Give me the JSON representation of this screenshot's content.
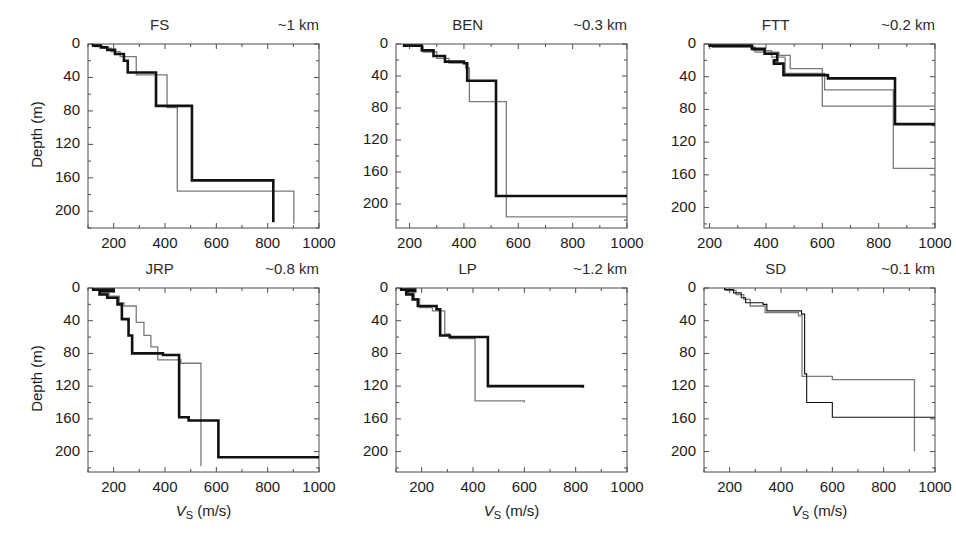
{
  "figure": {
    "ylabel": "Depth (m)",
    "xlabel_symbol": "V",
    "xlabel_subscript": "S",
    "xlabel_units": " (m/s)",
    "y_ticks": [
      0,
      40,
      80,
      120,
      160,
      200
    ],
    "x_ticks": [
      200,
      400,
      600,
      800,
      1000
    ],
    "colors": {
      "primary_profile": "#111111",
      "secondary_profile": "#7a7a7a",
      "axis": "#4d4d4d",
      "background": "#ffffff"
    }
  },
  "chart_data": [
    {
      "type": "line",
      "title": "FS",
      "annotation": "~1 km",
      "xlabel": "VS (m/s)",
      "ylabel": "Depth (m)",
      "xlim": [
        100,
        1000
      ],
      "ylim": [
        0,
        220
      ],
      "y_inverted": true,
      "grid": false,
      "x_ticks": [
        200,
        400,
        600,
        800,
        1000
      ],
      "y_ticks": [
        0,
        40,
        80,
        120,
        160,
        200
      ],
      "series": [
        {
          "name": "black-profile",
          "style": "thick-black",
          "layers": [
            {
              "vs": 120,
              "top": 0,
              "bottom": 2
            },
            {
              "vs": 150,
              "top": 2,
              "bottom": 4
            },
            {
              "vs": 175,
              "top": 4,
              "bottom": 7
            },
            {
              "vs": 205,
              "top": 7,
              "bottom": 12
            },
            {
              "vs": 240,
              "top": 12,
              "bottom": 20
            },
            {
              "vs": 255,
              "top": 20,
              "bottom": 34
            },
            {
              "vs": 365,
              "top": 34,
              "bottom": 74
            },
            {
              "vs": 505,
              "top": 74,
              "bottom": 163
            },
            {
              "vs": 822,
              "top": 163,
              "bottom": 213
            }
          ]
        },
        {
          "name": "gray-profile",
          "style": "thin-gray",
          "layers": [
            {
              "vs": 125,
              "top": 0,
              "bottom": 3
            },
            {
              "vs": 160,
              "top": 3,
              "bottom": 5
            },
            {
              "vs": 190,
              "top": 5,
              "bottom": 9
            },
            {
              "vs": 225,
              "top": 9,
              "bottom": 15
            },
            {
              "vs": 288,
              "top": 15,
              "bottom": 37
            },
            {
              "vs": 408,
              "top": 37,
              "bottom": 76
            },
            {
              "vs": 448,
              "top": 76,
              "bottom": 176
            },
            {
              "vs": 902,
              "top": 176,
              "bottom": 215
            }
          ]
        }
      ]
    },
    {
      "type": "line",
      "title": "BEN",
      "annotation": "~0.3 km",
      "xlabel": "VS (m/s)",
      "ylabel": "Depth (m)",
      "xlim": [
        150,
        1000
      ],
      "ylim": [
        0,
        230
      ],
      "y_inverted": true,
      "grid": false,
      "x_ticks": [
        200,
        400,
        600,
        800,
        1000
      ],
      "y_ticks": [
        0,
        40,
        80,
        120,
        160,
        200
      ],
      "series": [
        {
          "name": "black-profile",
          "style": "thick-black",
          "layers": [
            {
              "vs": 180,
              "top": 0,
              "bottom": 2
            },
            {
              "vs": 245,
              "top": 2,
              "bottom": 8
            },
            {
              "vs": 288,
              "top": 8,
              "bottom": 15
            },
            {
              "vs": 330,
              "top": 15,
              "bottom": 22
            },
            {
              "vs": 400,
              "top": 22,
              "bottom": 24
            },
            {
              "vs": 412,
              "top": 24,
              "bottom": 46
            },
            {
              "vs": 518,
              "top": 46,
              "bottom": 190
            },
            {
              "vs": 1000,
              "top": 190,
              "bottom": 190
            }
          ]
        },
        {
          "name": "gray-profile",
          "style": "thin-gray",
          "layers": [
            {
              "vs": 185,
              "top": 0,
              "bottom": 3
            },
            {
              "vs": 250,
              "top": 3,
              "bottom": 10
            },
            {
              "vs": 300,
              "top": 10,
              "bottom": 18
            },
            {
              "vs": 345,
              "top": 18,
              "bottom": 24
            },
            {
              "vs": 406,
              "top": 24,
              "bottom": 30
            },
            {
              "vs": 420,
              "top": 30,
              "bottom": 72
            },
            {
              "vs": 556,
              "top": 72,
              "bottom": 216
            },
            {
              "vs": 1000,
              "top": 216,
              "bottom": 216
            }
          ]
        }
      ]
    },
    {
      "type": "line",
      "title": "FTT",
      "annotation": "~0.2 km",
      "xlabel": "VS (m/s)",
      "ylabel": "Depth (m)",
      "xlim": [
        180,
        1000
      ],
      "ylim": [
        0,
        225
      ],
      "y_inverted": true,
      "grid": false,
      "x_ticks": [
        200,
        400,
        600,
        800,
        1000
      ],
      "y_ticks": [
        0,
        40,
        80,
        120,
        160,
        200
      ],
      "series": [
        {
          "name": "black-profile",
          "style": "thick-black",
          "layers": [
            {
              "vs": 200,
              "top": 0,
              "bottom": 2
            },
            {
              "vs": 350,
              "top": 2,
              "bottom": 6
            },
            {
              "vs": 395,
              "top": 6,
              "bottom": 12
            },
            {
              "vs": 440,
              "top": 12,
              "bottom": 20
            },
            {
              "vs": 428,
              "top": 20,
              "bottom": 24
            },
            {
              "vs": 462,
              "top": 24,
              "bottom": 38
            },
            {
              "vs": 620,
              "top": 38,
              "bottom": 42
            },
            {
              "vs": 858,
              "top": 42,
              "bottom": 98
            },
            {
              "vs": 1000,
              "top": 98,
              "bottom": 98
            }
          ]
        },
        {
          "name": "gray-profile-1",
          "style": "thin-gray",
          "layers": [
            {
              "vs": 205,
              "top": 0,
              "bottom": 3
            },
            {
              "vs": 355,
              "top": 3,
              "bottom": 8
            },
            {
              "vs": 420,
              "top": 8,
              "bottom": 16
            },
            {
              "vs": 468,
              "top": 16,
              "bottom": 36
            },
            {
              "vs": 608,
              "top": 36,
              "bottom": 56
            },
            {
              "vs": 852,
              "top": 56,
              "bottom": 152
            },
            {
              "vs": 1000,
              "top": 152,
              "bottom": 152
            }
          ]
        },
        {
          "name": "gray-profile-2",
          "style": "thin-gray",
          "layers": [
            {
              "vs": 210,
              "top": 0,
              "bottom": 4
            },
            {
              "vs": 362,
              "top": 4,
              "bottom": 10
            },
            {
              "vs": 446,
              "top": 10,
              "bottom": 14
            },
            {
              "vs": 486,
              "top": 14,
              "bottom": 30
            },
            {
              "vs": 600,
              "top": 30,
              "bottom": 76
            },
            {
              "vs": 1000,
              "top": 76,
              "bottom": 76
            }
          ]
        }
      ]
    },
    {
      "type": "line",
      "title": "JRP",
      "annotation": "~0.8 km",
      "xlabel": "VS (m/s)",
      "ylabel": "Depth (m)",
      "xlim": [
        100,
        1000
      ],
      "ylim": [
        0,
        225
      ],
      "y_inverted": true,
      "grid": false,
      "x_ticks": [
        200,
        400,
        600,
        800,
        1000
      ],
      "y_ticks": [
        0,
        40,
        80,
        120,
        160,
        200
      ],
      "series": [
        {
          "name": "black-profile",
          "style": "thick-black",
          "layers": [
            {
              "vs": 120,
              "top": 0,
              "bottom": 2
            },
            {
              "vs": 200,
              "top": 2,
              "bottom": 4
            },
            {
              "vs": 145,
              "top": 4,
              "bottom": 8
            },
            {
              "vs": 175,
              "top": 8,
              "bottom": 12
            },
            {
              "vs": 215,
              "top": 12,
              "bottom": 20
            },
            {
              "vs": 232,
              "top": 20,
              "bottom": 38
            },
            {
              "vs": 258,
              "top": 38,
              "bottom": 58
            },
            {
              "vs": 272,
              "top": 58,
              "bottom": 80
            },
            {
              "vs": 392,
              "top": 80,
              "bottom": 82
            },
            {
              "vs": 455,
              "top": 82,
              "bottom": 158
            },
            {
              "vs": 492,
              "top": 158,
              "bottom": 162
            },
            {
              "vs": 608,
              "top": 162,
              "bottom": 207
            },
            {
              "vs": 1000,
              "top": 207,
              "bottom": 207
            }
          ]
        },
        {
          "name": "gray-profile",
          "style": "thin-gray",
          "layers": [
            {
              "vs": 125,
              "top": 0,
              "bottom": 3
            },
            {
              "vs": 150,
              "top": 3,
              "bottom": 6
            },
            {
              "vs": 182,
              "top": 6,
              "bottom": 10
            },
            {
              "vs": 222,
              "top": 10,
              "bottom": 18
            },
            {
              "vs": 240,
              "top": 18,
              "bottom": 22
            },
            {
              "vs": 288,
              "top": 22,
              "bottom": 42
            },
            {
              "vs": 318,
              "top": 42,
              "bottom": 58
            },
            {
              "vs": 345,
              "top": 58,
              "bottom": 72
            },
            {
              "vs": 372,
              "top": 72,
              "bottom": 88
            },
            {
              "vs": 462,
              "top": 88,
              "bottom": 92
            },
            {
              "vs": 540,
              "top": 92,
              "bottom": 218
            }
          ]
        }
      ]
    },
    {
      "type": "line",
      "title": "LP",
      "annotation": "~1.2 km",
      "xlabel": "VS (m/s)",
      "ylabel": "Depth (m)",
      "xlim": [
        100,
        1000
      ],
      "ylim": [
        0,
        225
      ],
      "y_inverted": true,
      "grid": false,
      "x_ticks": [
        200,
        400,
        600,
        800,
        1000
      ],
      "y_ticks": [
        0,
        40,
        80,
        120,
        160,
        200
      ],
      "series": [
        {
          "name": "black-profile",
          "style": "thick-black",
          "layers": [
            {
              "vs": 120,
              "top": 0,
              "bottom": 2
            },
            {
              "vs": 175,
              "top": 2,
              "bottom": 4
            },
            {
              "vs": 140,
              "top": 4,
              "bottom": 8
            },
            {
              "vs": 165,
              "top": 8,
              "bottom": 14
            },
            {
              "vs": 185,
              "top": 14,
              "bottom": 22
            },
            {
              "vs": 258,
              "top": 22,
              "bottom": 26
            },
            {
              "vs": 272,
              "top": 26,
              "bottom": 58
            },
            {
              "vs": 310,
              "top": 58,
              "bottom": 60
            },
            {
              "vs": 458,
              "top": 60,
              "bottom": 120
            },
            {
              "vs": 828,
              "top": 120,
              "bottom": 122
            }
          ]
        },
        {
          "name": "gray-profile",
          "style": "thin-gray",
          "layers": [
            {
              "vs": 122,
              "top": 0,
              "bottom": 3
            },
            {
              "vs": 148,
              "top": 3,
              "bottom": 7
            },
            {
              "vs": 172,
              "top": 7,
              "bottom": 13
            },
            {
              "vs": 192,
              "top": 13,
              "bottom": 24
            },
            {
              "vs": 242,
              "top": 24,
              "bottom": 28
            },
            {
              "vs": 290,
              "top": 28,
              "bottom": 56
            },
            {
              "vs": 308,
              "top": 56,
              "bottom": 62
            },
            {
              "vs": 408,
              "top": 62,
              "bottom": 138
            },
            {
              "vs": 600,
              "top": 138,
              "bottom": 140
            }
          ]
        }
      ]
    },
    {
      "type": "line",
      "title": "SD",
      "annotation": "~0.1 km",
      "xlabel": "VS (m/s)",
      "ylabel": "Depth (m)",
      "xlim": [
        100,
        1000
      ],
      "ylim": [
        0,
        225
      ],
      "y_inverted": true,
      "grid": false,
      "x_ticks": [
        200,
        400,
        600,
        800,
        1000
      ],
      "y_ticks": [
        0,
        40,
        80,
        120,
        160,
        200
      ],
      "series": [
        {
          "name": "black-profile",
          "style": "thin-black",
          "layers": [
            {
              "vs": 180,
              "top": 0,
              "bottom": 2
            },
            {
              "vs": 215,
              "top": 2,
              "bottom": 6
            },
            {
              "vs": 245,
              "top": 6,
              "bottom": 12
            },
            {
              "vs": 262,
              "top": 12,
              "bottom": 18
            },
            {
              "vs": 330,
              "top": 18,
              "bottom": 20
            },
            {
              "vs": 345,
              "top": 20,
              "bottom": 28
            },
            {
              "vs": 480,
              "top": 28,
              "bottom": 32
            },
            {
              "vs": 492,
              "top": 32,
              "bottom": 105
            },
            {
              "vs": 500,
              "top": 105,
              "bottom": 140
            },
            {
              "vs": 600,
              "top": 140,
              "bottom": 158
            },
            {
              "vs": 1000,
              "top": 158,
              "bottom": 158
            }
          ]
        },
        {
          "name": "gray-profile",
          "style": "thin-gray",
          "layers": [
            {
              "vs": 185,
              "top": 0,
              "bottom": 3
            },
            {
              "vs": 225,
              "top": 3,
              "bottom": 8
            },
            {
              "vs": 255,
              "top": 8,
              "bottom": 14
            },
            {
              "vs": 280,
              "top": 14,
              "bottom": 22
            },
            {
              "vs": 338,
              "top": 22,
              "bottom": 30
            },
            {
              "vs": 468,
              "top": 30,
              "bottom": 34
            },
            {
              "vs": 482,
              "top": 34,
              "bottom": 108
            },
            {
              "vs": 600,
              "top": 108,
              "bottom": 112
            },
            {
              "vs": 920,
              "top": 112,
              "bottom": 200
            }
          ]
        }
      ]
    }
  ]
}
